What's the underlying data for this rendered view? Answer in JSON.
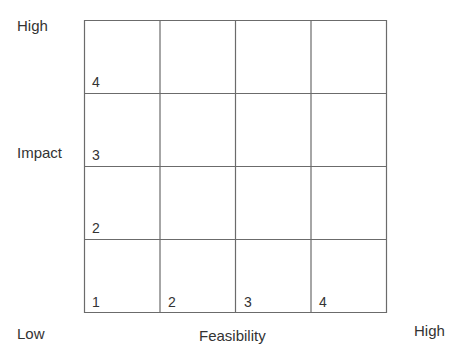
{
  "diagram": {
    "type": "matrix-grid",
    "rows": 4,
    "columns": 4,
    "y_axis": {
      "title": "Impact",
      "high_label": "High",
      "row_numbers": [
        "4",
        "3",
        "2",
        "1"
      ]
    },
    "x_axis": {
      "title": "Feasibility",
      "low_label": "Low",
      "high_label": "High",
      "column_numbers": [
        "1",
        "2",
        "3",
        "4"
      ]
    },
    "colors": {
      "line": "#6b6b6b",
      "text": "#333333",
      "background": "#ffffff"
    }
  }
}
